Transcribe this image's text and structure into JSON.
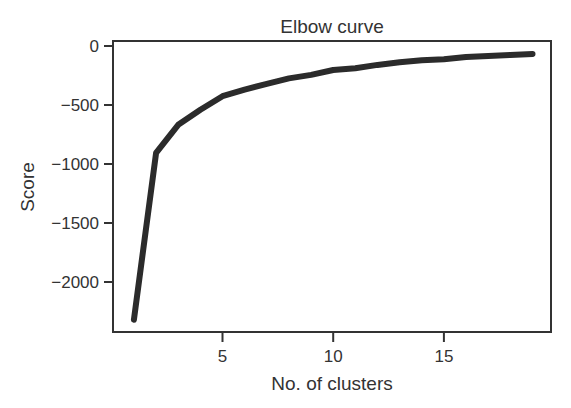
{
  "chart_data": {
    "type": "line",
    "title": "Elbow curve",
    "xlabel": "No. of clusters",
    "ylabel": "Score",
    "x": [
      1,
      2,
      3,
      4,
      5,
      6,
      7,
      8,
      9,
      10,
      11,
      12,
      13,
      14,
      15,
      16,
      17,
      18,
      19
    ],
    "series": [
      {
        "name": "Score",
        "values": [
          -2320,
          -905,
          -668,
          -540,
          -425,
          -370,
          -320,
          -275,
          -245,
          -203,
          -188,
          -160,
          -138,
          -121,
          -112,
          -92,
          -85,
          -76,
          -68
        ]
      }
    ],
    "xticks": [
      5,
      10,
      15
    ],
    "xtick_labels": [
      "5",
      "10",
      "15"
    ],
    "yticks": [
      0,
      -500,
      -1000,
      -1500,
      -2000
    ],
    "ytick_labels": [
      "0",
      "−500",
      "−1000",
      "−1500",
      "−2000"
    ],
    "xlim": [
      0.1,
      19.9
    ],
    "ylim": [
      -2420,
      45
    ],
    "grid": false,
    "legend": null,
    "line_color": "#2b2b2b"
  }
}
